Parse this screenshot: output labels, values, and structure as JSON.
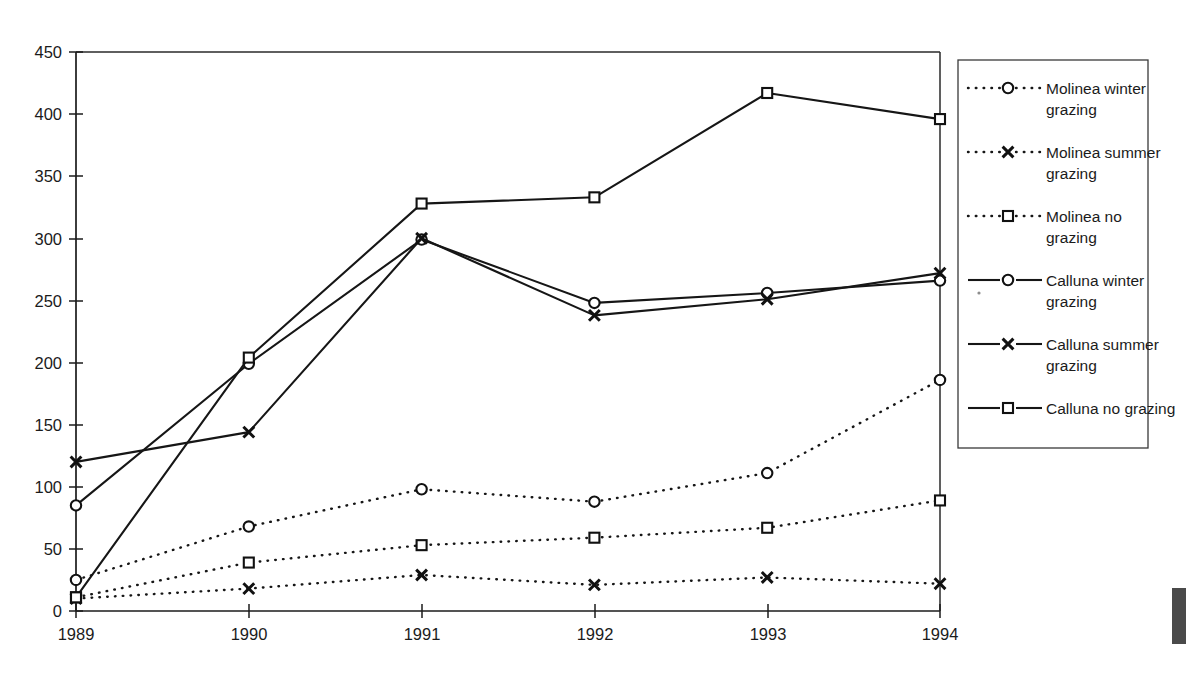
{
  "chart_data": {
    "type": "line",
    "title": "",
    "xlabel": "",
    "ylabel": "",
    "categories": [
      "1989",
      "1990",
      "1991",
      "1992",
      "1993",
      "1994"
    ],
    "x_tick_labels": [
      "1989",
      "1990",
      "1991",
      "1992",
      "1993",
      "1994"
    ],
    "y_tick_labels": [
      "0",
      "50",
      "100",
      "150",
      "200",
      "250",
      "300",
      "350",
      "400",
      "450"
    ],
    "y_ticks": [
      0,
      50,
      100,
      150,
      200,
      250,
      300,
      350,
      400,
      450
    ],
    "ylim": [
      0,
      450
    ],
    "grid": false,
    "legend_position": "right",
    "series": [
      {
        "name": "Molinea winter grazing",
        "marker": "circle-open",
        "line_style": "dotted",
        "values": [
          25,
          68,
          98,
          88,
          111,
          186
        ]
      },
      {
        "name": "Molinea summer grazing",
        "marker": "x",
        "line_style": "dotted",
        "values": [
          10,
          18,
          29,
          21,
          27,
          22
        ]
      },
      {
        "name": "Molinea no grazing",
        "marker": "square-open",
        "line_style": "dotted",
        "values": [
          11,
          39,
          53,
          59,
          67,
          89
        ]
      },
      {
        "name": "Calluna winter grazing",
        "marker": "circle-open",
        "line_style": "solid",
        "values": [
          85,
          199,
          299,
          248,
          256,
          266
        ]
      },
      {
        "name": "Calluna summer grazing",
        "marker": "x",
        "line_style": "solid",
        "values": [
          120,
          144,
          300,
          238,
          251,
          272
        ]
      },
      {
        "name": "Calluna no grazing",
        "marker": "square-open",
        "line_style": "solid",
        "values": [
          11,
          204,
          328,
          333,
          417,
          396
        ]
      }
    ]
  },
  "legend": {
    "items": [
      {
        "label_line1": "Molinea winter",
        "label_line2": "grazing",
        "marker": "circle-open-icon",
        "line_style": "dotted"
      },
      {
        "label_line1": "Molinea summer",
        "label_line2": "grazing",
        "marker": "x-icon",
        "line_style": "dotted"
      },
      {
        "label_line1": "Molinea no",
        "label_line2": "grazing",
        "marker": "square-open-icon",
        "line_style": "dotted"
      },
      {
        "label_line1": "Calluna winter",
        "label_line2": "grazing",
        "marker": "circle-open-icon",
        "line_style": "solid"
      },
      {
        "label_line1": "Calluna summer",
        "label_line2": "grazing",
        "marker": "x-icon",
        "line_style": "solid"
      },
      {
        "label_line1": "Calluna no grazing",
        "label_line2": "",
        "marker": "square-open-icon",
        "line_style": "solid"
      }
    ]
  },
  "colors": {
    "ink": "#161616",
    "background": "#ffffff",
    "frame": "#2a2a2a"
  }
}
